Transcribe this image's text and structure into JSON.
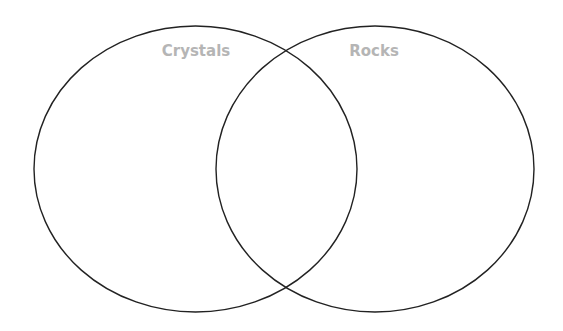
{
  "diagram": {
    "type": "venn",
    "sets": [
      {
        "label": "Crystals",
        "cx": 195.5,
        "cy": 169,
        "rx": 161.5,
        "ry": 143
      },
      {
        "label": "Rocks",
        "cx": 375,
        "cy": 169,
        "rx": 159,
        "ry": 143
      }
    ],
    "colors": {
      "outline": "#222222",
      "label": "#b5b5b5",
      "background": "#ffffff"
    }
  }
}
